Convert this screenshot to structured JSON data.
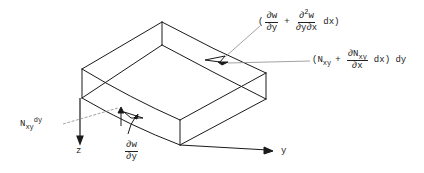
{
  "diagram": {
    "type": "plate element free-body diagram (isometric)",
    "axes": {
      "z_label": "z",
      "y_label": "y"
    },
    "labels": {
      "slope_increment": {
        "open": "(",
        "term1_num": "∂w",
        "term1_den": "∂y",
        "plus": "+",
        "term2_num_base": "∂",
        "term2_num_sup": "2",
        "term2_num_var": "w",
        "term2_den": "∂y∂x",
        "tail": "dx)"
      },
      "shear_force_increment": {
        "open": "(N",
        "open_sub": "xy",
        "plus": "+",
        "frac_num": "∂N",
        "frac_num_sub": "xy",
        "frac_den": "∂x",
        "tail": "dx) dy"
      },
      "shear_force": {
        "base": "N",
        "sub": "xy",
        "tail": "dy"
      },
      "slope": {
        "num": "∂w",
        "den": "∂y"
      }
    },
    "colors": {
      "line": "#1a1a1a",
      "leader": "#8a8a8a",
      "background": "#ffffff"
    }
  }
}
